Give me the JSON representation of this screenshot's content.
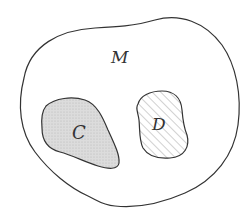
{
  "diagram": {
    "sets": [
      {
        "id": "M",
        "label": "M",
        "role": "universe",
        "fill": "none",
        "stroke": "#333333"
      },
      {
        "id": "C",
        "label": "C",
        "role": "subset",
        "fill": "stippled-gray",
        "fill_color": "#d9d9d9",
        "stroke": "#333333"
      },
      {
        "id": "D",
        "label": "D",
        "role": "subset",
        "fill": "diagonal-hatch",
        "hatch_color": "#999999",
        "stroke": "#333333"
      }
    ],
    "labels": {
      "M": "M",
      "C": "C",
      "D": "D"
    }
  },
  "colors": {
    "stroke": "#333333",
    "stipple_base": "#dcdcdc",
    "stipple_dot": "#b0b0b0",
    "hatch": "#9a9a9a",
    "background": "#ffffff"
  }
}
